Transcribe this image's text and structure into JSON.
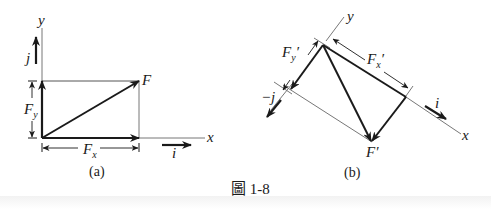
{
  "figure": {
    "caption_prefix": "圖",
    "caption_number": "1-8",
    "colors": {
      "ink": "#1a1a1a",
      "thin_line": "#777777",
      "background": "#ffffff"
    }
  },
  "panel_a": {
    "label": "(a)",
    "axis_x": "x",
    "axis_y": "y",
    "vector_F": "F",
    "component_x": "F",
    "component_x_sub": "x",
    "component_y": "F",
    "component_y_sub": "y",
    "unit_i": "i",
    "unit_j": "j"
  },
  "panel_b": {
    "label": "(b)",
    "axis_x": "x",
    "axis_y": "y",
    "vector_F": "F′",
    "component_x": "F",
    "component_x_sub": "x",
    "component_x_prime": "′",
    "component_y": "F",
    "component_y_sub": "y",
    "component_y_prime": "′",
    "unit_i": "i",
    "unit_neg_j": "−j"
  }
}
